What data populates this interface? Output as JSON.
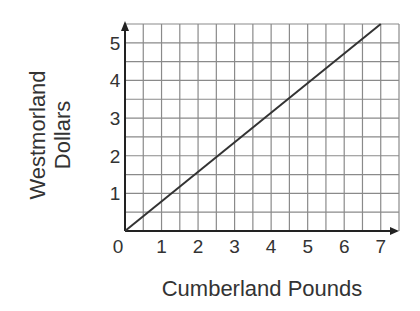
{
  "chart_data": {
    "type": "line",
    "title": "",
    "xlabel": "Cumberland Pounds",
    "ylabel": "Westmorland Dollars",
    "ylabel_lines": [
      "Westmorland",
      "Dollars"
    ],
    "x_ticks": [
      "0",
      "1",
      "2",
      "3",
      "4",
      "5",
      "6",
      "7"
    ],
    "y_ticks": [
      "1",
      "2",
      "3",
      "4",
      "5"
    ],
    "origin_label": "0",
    "xlim": [
      0,
      7.5
    ],
    "ylim": [
      0,
      5.5
    ],
    "grid": true,
    "grid_step": 0.5,
    "legend": null,
    "series": [
      {
        "name": "exchange rate",
        "x": [
          0,
          7
        ],
        "y": [
          0,
          5.5
        ]
      }
    ]
  },
  "colors": {
    "grid": "#8a8a8a",
    "axis": "#222222",
    "line": "#333333",
    "text": "#333333"
  }
}
